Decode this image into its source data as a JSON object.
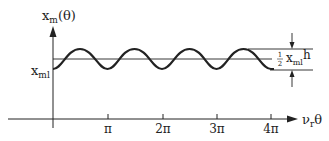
{
  "diagram": {
    "type": "waveform-plot",
    "y_axis_label": {
      "base": "x",
      "sub": "m",
      "arg": "(θ)"
    },
    "x_axis_label": {
      "base": "ν",
      "sub": "r",
      "tail": "θ"
    },
    "baseline_label": {
      "base": "x",
      "sub": "ml"
    },
    "amplitude_label": {
      "frac_num": "1",
      "frac_den": "2",
      "base": "x",
      "sub": "ml",
      "tail": "h"
    },
    "x_ticks": [
      "π",
      "2π",
      "3π",
      "4π"
    ],
    "waveform": {
      "shape": "sinusoid",
      "periods": 4,
      "starts_at": "trough",
      "description": "x_m(θ) oscillates around a mean line above x_ml with peak-to-peak amplitude ½ x_ml h"
    },
    "colors": {
      "ink": "#222222",
      "background": "#ffffff"
    }
  }
}
